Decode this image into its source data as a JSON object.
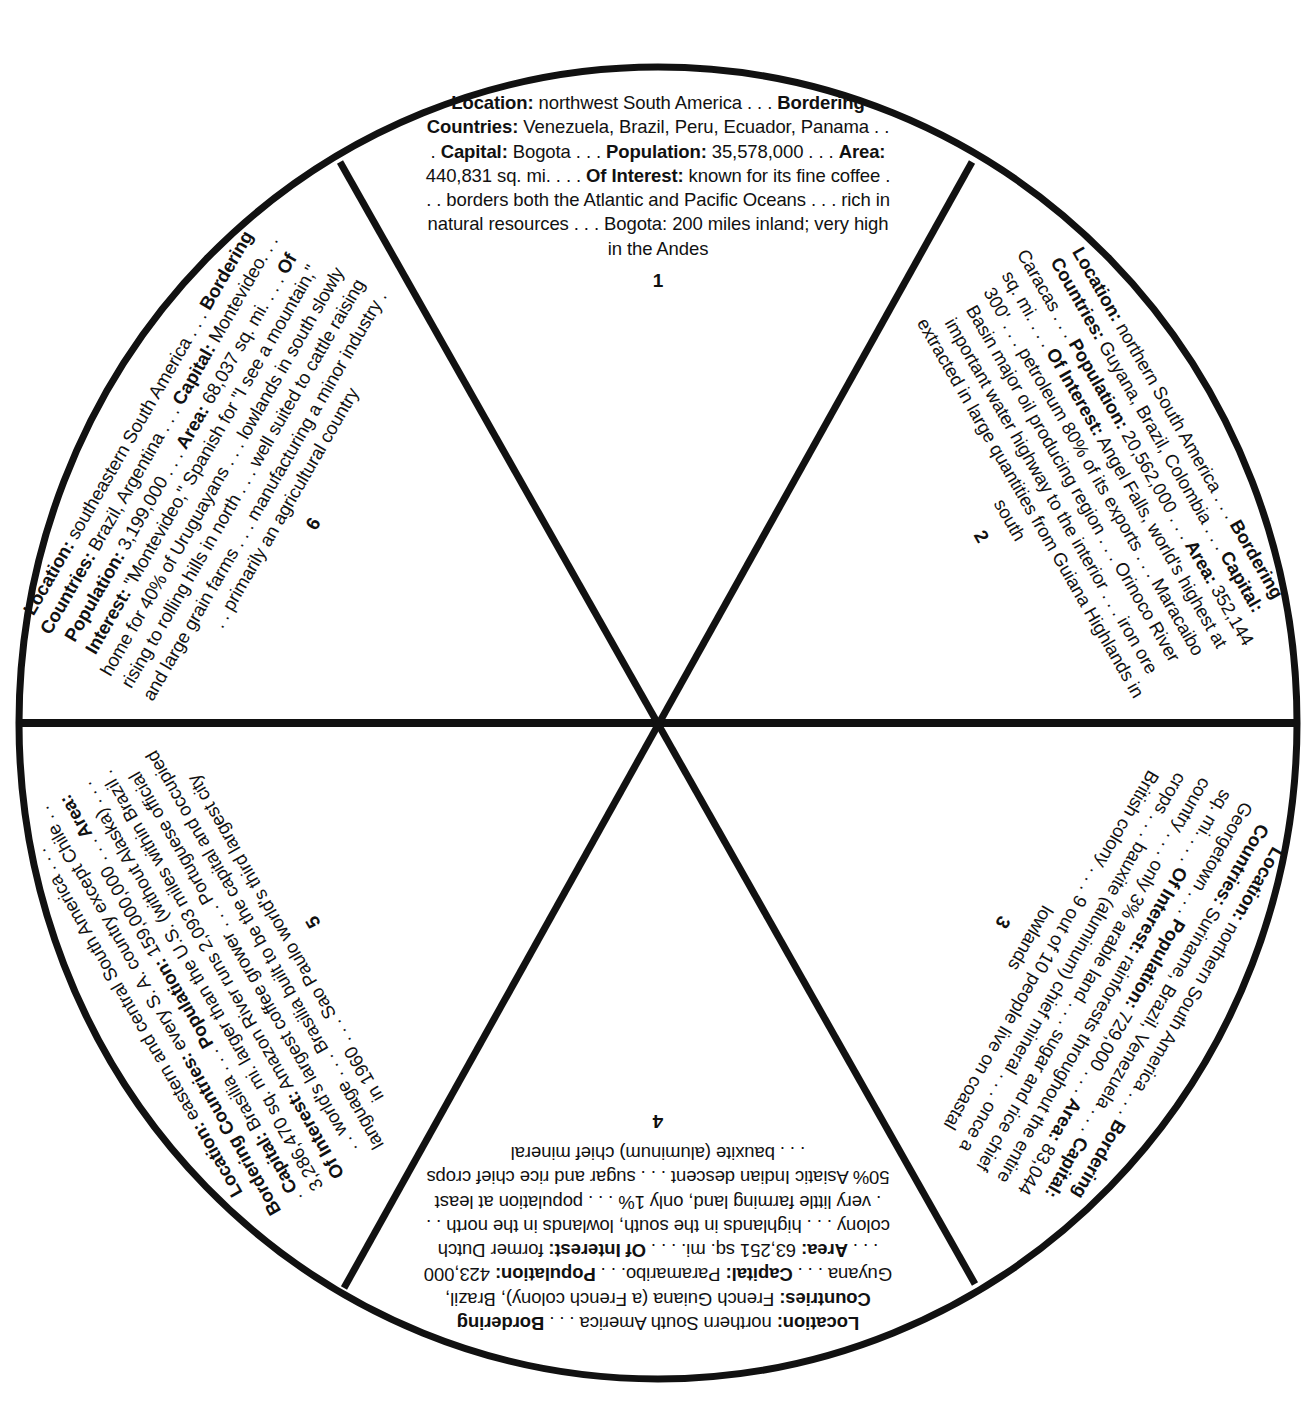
{
  "diagram": {
    "type": "wheel",
    "stroke_color": "#111111",
    "background": "#ffffff",
    "segments": [
      {
        "number": "1",
        "rotation_deg": 0,
        "fields": [
          {
            "label": "Location:",
            "value": " northwest South America . . . "
          },
          {
            "label": "Bordering Countries:",
            "value": " Venezuela, Brazil, Peru, Ecuador, Panama . . . "
          },
          {
            "label": "Capital:",
            "value": " Bogota . . . "
          },
          {
            "label": "Population:",
            "value": " 35,578,000 . . . "
          },
          {
            "label": "Area:",
            "value": " 440,831 sq. mi. . . . "
          },
          {
            "label": "Of Interest:",
            "value": " known for its fine coffee . . . borders both the Atlantic and Pacific Oceans . . . rich in natural resources . . . Bogota: 200 miles inland; very high in the Andes"
          }
        ]
      },
      {
        "number": "2",
        "rotation_deg": 60,
        "fields": [
          {
            "label": "Location:",
            "value": " northern South America . . . "
          },
          {
            "label": "Bordering Countries:",
            "value": " Guyana, Brazil, Colombia . . . "
          },
          {
            "label": "Capital:",
            "value": " Caracas . . . "
          },
          {
            "label": "Population:",
            "value": " 20,562,000 . . . "
          },
          {
            "label": "Area:",
            "value": " 352,144 sq. mi. . . . "
          },
          {
            "label": "Of Interest:",
            "value": " Angel Falls, world's highest at 300' . . . petroleum 80% of its exports . . . Maracaibo Basin major oil producing region . . . Orinoco River important water highway to the interior . . . iron ore extracted in large quantities from Guiana Highlands in south"
          }
        ]
      },
      {
        "number": "3",
        "rotation_deg": 120,
        "fields": [
          {
            "label": "Location:",
            "value": " northern South America . . . "
          },
          {
            "label": "Bordering Countries:",
            "value": " Suriname, Brazil, Venezuela . . . "
          },
          {
            "label": "Capital:",
            "value": " Georgetown . . . "
          },
          {
            "label": "Population:",
            "value": " 729,000 . . . "
          },
          {
            "label": "Area:",
            "value": " 83,044 sq. mi. . . . "
          },
          {
            "label": "Of Interest:",
            "value": " rainforests throughout the entire country . . . only 3% arable land . . . sugar and rice chief crops . . . bauxite (aluminum) chief mineral . . . once a British colony . . . 9 out of 10 people live on coastal lowlands"
          }
        ]
      },
      {
        "number": "4",
        "rotation_deg": 180,
        "fields": [
          {
            "label": "Location:",
            "value": " northern South America . . . "
          },
          {
            "label": "Bordering Countries:",
            "value": " French Guiana (a French colony), Brazil, Guyana . . . "
          },
          {
            "label": "Capital:",
            "value": " Paramaribo. . . "
          },
          {
            "label": "Population:",
            "value": " 423,000 . . . "
          },
          {
            "label": "Area:",
            "value": " 63,251 sq. mi. . . . "
          },
          {
            "label": "Of Interest:",
            "value": " former Dutch colony . . . highlands in the south, lowlands in the north . . . very little farming land, only 1% . . . population at least 50% Asiatic Indian descent . . . sugar and rice chief crops . . . bauxite (aluminum) chief mineral"
          }
        ]
      },
      {
        "number": "5",
        "rotation_deg": 240,
        "fields": [
          {
            "label": "Location:",
            "value": " eastern and central South America . . . "
          },
          {
            "label": "Bordering Countries:",
            "value": " every S. A. country except Chile . . . "
          },
          {
            "label": "Capital:",
            "value": " Brasilia . . . "
          },
          {
            "label": "Population:",
            "value": " 159,000,000 . . . "
          },
          {
            "label": "Area:",
            "value": " 3,286,470 sq. mi. larger than the U.S. (without Alaska) . . . "
          },
          {
            "label": "Of Interest:",
            "value": " Amazon River runs 2,093 miles within Brazil . . . world's largest coffee grower . . . Portuguese official language . . . Brasilia built to be the capital and occupied in 1960 . . . Sao Paulo world's third largest city"
          }
        ]
      },
      {
        "number": "6",
        "rotation_deg": 300,
        "fields": [
          {
            "label": "Location:",
            "value": " southeastern South America . . . "
          },
          {
            "label": "Bordering Countries:",
            "value": " Brazil, Argentina . . . "
          },
          {
            "label": "Capital:",
            "value": " Montevideo. . . "
          },
          {
            "label": "Population:",
            "value": " 3,199,000 . . . "
          },
          {
            "label": "Area:",
            "value": " 68,037 sq. mi. . . . "
          },
          {
            "label": "Of Interest:",
            "value": " \"Montevideo,\" Spanish for \"I see a mountain,\" home for 40% of Uruguayans . . . lowlands in south slowly rising to rolling hills in north . . . well suited to cattle raising and large grain farms . . . manufacturing a minor industry . . . primarily an agricultural country"
          }
        ]
      }
    ]
  }
}
